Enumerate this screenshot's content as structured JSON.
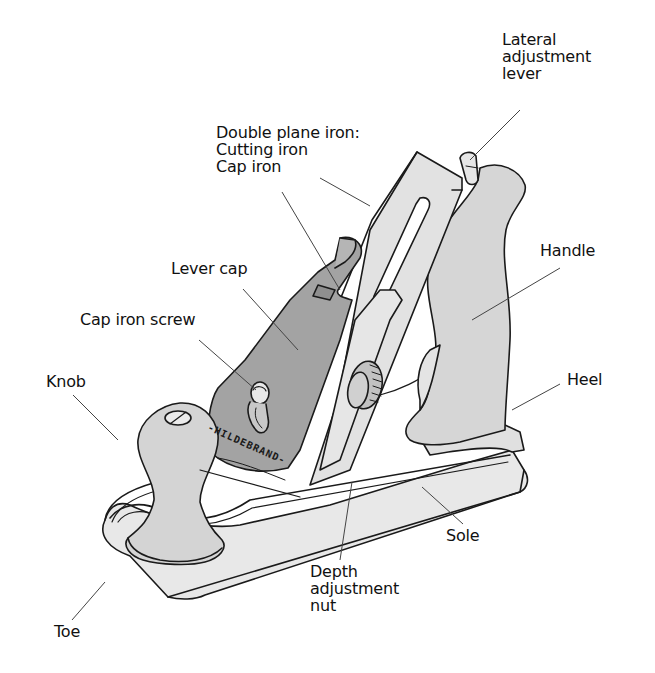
{
  "diagram": {
    "colors": {
      "background": "#ffffff",
      "ink": "#1a1a1a",
      "light_metal": "#e4e4e4",
      "medium_gray": "#d2d2d2",
      "lever_cap": "#a3a3a3",
      "leader_line": "#444444"
    },
    "brand_marking": "-HILDEBRAND-",
    "labels": {
      "lateral": {
        "line1": "Lateral",
        "line2": "adjustment",
        "line3": "lever"
      },
      "double_iron": {
        "line1": "Double plane iron:",
        "line2": "Cutting iron",
        "line3": "Cap iron"
      },
      "lever_cap": "Lever cap",
      "cap_iron_screw": "Cap iron screw",
      "knob": "Knob",
      "handle": "Handle",
      "heel": "Heel",
      "sole": "Sole",
      "depth": {
        "line1": "Depth",
        "line2": "adjustment",
        "line3": "nut"
      },
      "toe": "Toe"
    }
  }
}
